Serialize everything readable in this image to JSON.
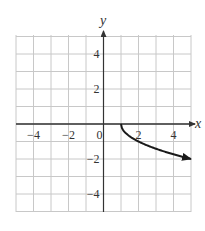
{
  "chart_data": {
    "type": "line",
    "title": "",
    "xlabel": "x",
    "ylabel": "y",
    "xlim": [
      -5,
      5
    ],
    "ylim": [
      -5,
      5
    ],
    "grid": true,
    "x_ticks": [
      -4,
      -2,
      0,
      2,
      4
    ],
    "y_ticks": [
      4,
      2,
      -2,
      -4
    ],
    "x_tick_labels": [
      "−4",
      "−2",
      "0",
      "2",
      "4"
    ],
    "y_tick_labels": [
      "4",
      "2",
      "−2",
      "−4"
    ],
    "series": [
      {
        "name": "y = -sqrt(x - 1)",
        "x": [
          1,
          1.25,
          1.5,
          2,
          2.5,
          3,
          3.5,
          4,
          4.5,
          5
        ],
        "y": [
          0,
          -0.5,
          -0.707,
          -1,
          -1.225,
          -1.414,
          -1.581,
          -1.732,
          -1.871,
          -2
        ],
        "start_point": [
          1,
          0
        ],
        "end_arrow": true
      }
    ],
    "legend": null
  },
  "colors": {
    "grid": "#c8c8c8",
    "axis": "#333333",
    "curve": "#1a1a1a",
    "background": "#ffffff"
  }
}
